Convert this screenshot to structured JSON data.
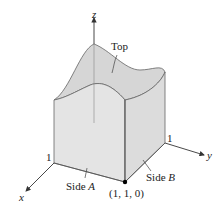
{
  "figure": {
    "axes": {
      "x_label": "x",
      "y_label": "y",
      "z_label": "z",
      "x_tick": "1",
      "y_tick": "1"
    },
    "labels": {
      "top": "Top",
      "side_a_prefix": "Side ",
      "side_a_letter": "A",
      "side_b_prefix": "Side ",
      "side_b_letter": "B",
      "corner_point": "(1, 1, 0)"
    },
    "colors": {
      "line": "#555555",
      "fill_top": "#d9d9d9",
      "fill_side": "#e6e6e6",
      "fill_base": "#eeeeee",
      "axis": "#333333"
    }
  }
}
